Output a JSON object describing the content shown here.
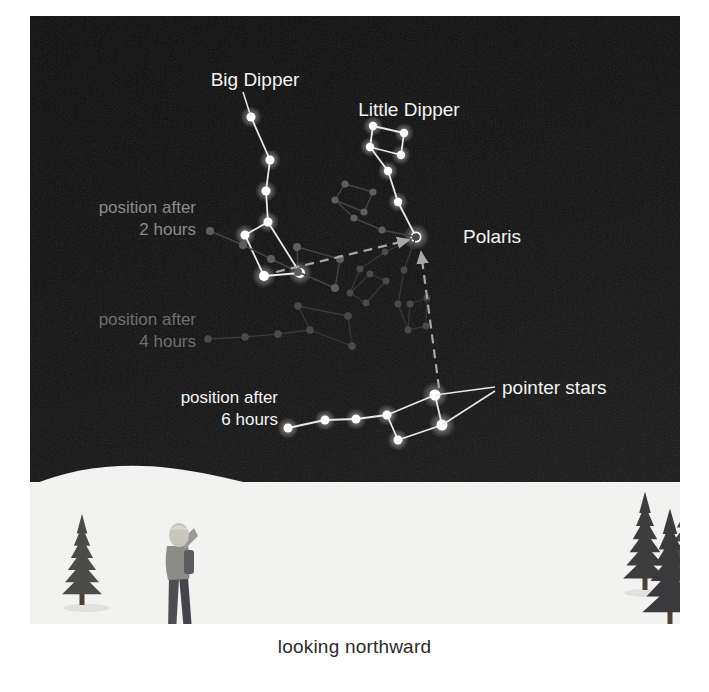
{
  "figure": {
    "caption": "looking northward",
    "view_direction": "north",
    "background_sky_color": "#0b0b0c",
    "snow_color": "#f2f2f0",
    "hill_color": "#1d1d20",
    "tree_color": "#3a3a3c"
  },
  "labels": {
    "big_dipper": "Big Dipper",
    "little_dipper": "Little Dipper",
    "polaris": "Polaris",
    "pointer_stars": "pointer stars",
    "position_2h_line1": "position after",
    "position_2h_line2": "2 hours",
    "position_4h_line1": "position after",
    "position_4h_line2": "4 hours",
    "position_6h_line1": "position after",
    "position_6h_line2": "6 hours"
  },
  "label_colors": {
    "bright": "#f4f4f2",
    "dim_2h": "#8b8b88",
    "dim_4h": "#6f6f6c",
    "bright_6h": "#f4f4f2"
  },
  "chart_data": {
    "type": "diagram",
    "subtitle": "looking northward",
    "annotations": [
      {
        "text": "Big Dipper",
        "x": 225,
        "y": 65,
        "color": "#f4f4f2",
        "size": 19,
        "anchor": "middle"
      },
      {
        "text": "Little Dipper",
        "x": 379,
        "y": 95,
        "color": "#f4f4f2",
        "size": 19,
        "anchor": "middle"
      },
      {
        "text": "Polaris",
        "x": 433,
        "y": 222,
        "color": "#f4f4f2",
        "size": 19,
        "anchor": "start"
      },
      {
        "text": "pointer stars",
        "x": 472,
        "y": 373,
        "color": "#f4f4f2",
        "size": 19,
        "anchor": "start"
      },
      {
        "text": "position after",
        "x": 166,
        "y": 193,
        "color": "#8b8b88",
        "size": 17,
        "anchor": "end"
      },
      {
        "text": "2 hours",
        "x": 166,
        "y": 215,
        "color": "#8b8b88",
        "size": 17,
        "anchor": "end"
      },
      {
        "text": "position after",
        "x": 166,
        "y": 305,
        "color": "#6f6f6c",
        "size": 17,
        "anchor": "end"
      },
      {
        "text": "4 hours",
        "x": 166,
        "y": 327,
        "color": "#6f6f6c",
        "size": 17,
        "anchor": "end"
      },
      {
        "text": "position after",
        "x": 248,
        "y": 383,
        "color": "#f4f4f2",
        "size": 17,
        "anchor": "end"
      },
      {
        "text": "6 hours",
        "x": 248,
        "y": 405,
        "color": "#f4f4f2",
        "size": 17,
        "anchor": "end"
      }
    ],
    "polaris": {
      "x": 386,
      "y": 221,
      "radius": 5.5,
      "color": "#ffffff"
    },
    "constellations": [
      {
        "name": "Little Dipper",
        "brightness": "bright",
        "star_color": "#ffffff",
        "line_color": "#e8e8e6",
        "line_width": 1.8,
        "stars": [
          {
            "id": "polaris",
            "x": 386,
            "y": 221,
            "r": 5.5
          },
          {
            "id": "ld2",
            "x": 368,
            "y": 186,
            "r": 4.2
          },
          {
            "id": "ld3",
            "x": 358,
            "y": 155,
            "r": 4.2
          },
          {
            "id": "ld4",
            "x": 340,
            "y": 131,
            "r": 4.2
          },
          {
            "id": "ld5",
            "x": 343,
            "y": 110,
            "r": 4.2
          },
          {
            "id": "ld6",
            "x": 374,
            "y": 117,
            "r": 4.2
          },
          {
            "id": "ld7",
            "x": 371,
            "y": 139,
            "r": 4.2
          }
        ],
        "edges": [
          [
            0,
            1
          ],
          [
            1,
            2
          ],
          [
            2,
            3
          ],
          [
            3,
            4
          ],
          [
            4,
            5
          ],
          [
            5,
            6
          ],
          [
            6,
            3
          ]
        ]
      },
      {
        "name": "Big Dipper (current)",
        "brightness": "bright",
        "star_color": "#ffffff",
        "line_color": "#e8e8e6",
        "line_width": 1.8,
        "stars": [
          {
            "id": "bd1-handle-tip",
            "x": 221,
            "y": 101,
            "r": 4.5
          },
          {
            "id": "bd2",
            "x": 240,
            "y": 144,
            "r": 4.5
          },
          {
            "id": "bd3",
            "x": 236,
            "y": 175,
            "r": 4.5
          },
          {
            "id": "bd4-bowl-tr",
            "x": 238,
            "y": 206,
            "r": 4.5
          },
          {
            "id": "bd5-bowl-tl",
            "x": 215,
            "y": 219,
            "r": 4.5
          },
          {
            "id": "bd6-bowl-bl",
            "x": 234,
            "y": 260,
            "r": 5.0
          },
          {
            "id": "bd7-bowl-br",
            "x": 270,
            "y": 257,
            "r": 5.0
          }
        ],
        "edges": [
          [
            0,
            1
          ],
          [
            1,
            2
          ],
          [
            2,
            3
          ],
          [
            3,
            4
          ],
          [
            4,
            5
          ],
          [
            5,
            6
          ],
          [
            6,
            3
          ]
        ],
        "pointer_pair": [
          "bd6-bowl-bl",
          "bd7-bowl-br"
        ]
      },
      {
        "name": "Big Dipper after 2 hours",
        "brightness": "dim",
        "star_color": "#5e5e5c",
        "line_color": "#444442",
        "line_width": 1.4,
        "stars": [
          {
            "id": "p2-1",
            "x": 180,
            "y": 215,
            "r": 4.0
          },
          {
            "id": "p2-2",
            "x": 213,
            "y": 229,
            "r": 4.0
          },
          {
            "id": "p2-3",
            "x": 241,
            "y": 243,
            "r": 4.0
          },
          {
            "id": "p2-4",
            "x": 268,
            "y": 256,
            "r": 4.0
          },
          {
            "id": "p2-5",
            "x": 267,
            "y": 231,
            "r": 4.0
          },
          {
            "id": "p2-6",
            "x": 310,
            "y": 243,
            "r": 4.0
          },
          {
            "id": "p2-7",
            "x": 305,
            "y": 272,
            "r": 4.0
          }
        ],
        "edges": [
          [
            0,
            1
          ],
          [
            1,
            2
          ],
          [
            2,
            3
          ],
          [
            3,
            4
          ],
          [
            4,
            5
          ],
          [
            5,
            6
          ],
          [
            6,
            3
          ]
        ]
      },
      {
        "name": "Little Dipper after 2 hours",
        "brightness": "dim",
        "star_color": "#5e5e5c",
        "line_color": "#444442",
        "line_width": 1.4,
        "stars": [
          {
            "id": "l2-1",
            "x": 386,
            "y": 221,
            "r": 3.6
          },
          {
            "id": "l2-2",
            "x": 352,
            "y": 214,
            "r": 3.6
          },
          {
            "id": "l2-3",
            "x": 324,
            "y": 202,
            "r": 3.6
          },
          {
            "id": "l2-4",
            "x": 305,
            "y": 184,
            "r": 3.6
          },
          {
            "id": "l2-5",
            "x": 315,
            "y": 168,
            "r": 3.6
          },
          {
            "id": "l2-6",
            "x": 343,
            "y": 176,
            "r": 3.6
          },
          {
            "id": "l2-7",
            "x": 334,
            "y": 196,
            "r": 3.6
          }
        ],
        "edges": [
          [
            0,
            1
          ],
          [
            1,
            2
          ],
          [
            2,
            3
          ],
          [
            3,
            4
          ],
          [
            4,
            5
          ],
          [
            5,
            6
          ],
          [
            6,
            3
          ]
        ]
      },
      {
        "name": "Big Dipper after 4 hours",
        "brightness": "dimmer",
        "star_color": "#4a4a48",
        "line_color": "#383836",
        "line_width": 1.3,
        "stars": [
          {
            "id": "p4-1",
            "x": 178,
            "y": 323,
            "r": 3.8
          },
          {
            "id": "p4-2",
            "x": 215,
            "y": 321,
            "r": 3.8
          },
          {
            "id": "p4-3",
            "x": 248,
            "y": 318,
            "r": 3.8
          },
          {
            "id": "p4-4",
            "x": 280,
            "y": 314,
            "r": 3.8
          },
          {
            "id": "p4-5",
            "x": 268,
            "y": 290,
            "r": 3.8
          },
          {
            "id": "p4-6",
            "x": 318,
            "y": 300,
            "r": 3.8
          },
          {
            "id": "p4-7",
            "x": 322,
            "y": 330,
            "r": 3.8
          }
        ],
        "edges": [
          [
            0,
            1
          ],
          [
            1,
            2
          ],
          [
            2,
            3
          ],
          [
            3,
            4
          ],
          [
            4,
            5
          ],
          [
            5,
            6
          ],
          [
            6,
            3
          ]
        ]
      },
      {
        "name": "Little Dipper after 4 hours",
        "brightness": "dimmer",
        "star_color": "#4a4a48",
        "line_color": "#383836",
        "line_width": 1.3,
        "stars": [
          {
            "id": "l4-1",
            "x": 386,
            "y": 221,
            "r": 3.4
          },
          {
            "id": "l4-2",
            "x": 355,
            "y": 236,
            "r": 3.4
          },
          {
            "id": "l4-3",
            "x": 330,
            "y": 253,
            "r": 3.4
          },
          {
            "id": "l4-4",
            "x": 320,
            "y": 277,
            "r": 3.4
          },
          {
            "id": "l4-5",
            "x": 336,
            "y": 287,
            "r": 3.4
          },
          {
            "id": "l4-6",
            "x": 356,
            "y": 265,
            "r": 3.4
          },
          {
            "id": "l4-7",
            "x": 340,
            "y": 258,
            "r": 3.4
          }
        ],
        "edges": [
          [
            0,
            1
          ],
          [
            1,
            2
          ],
          [
            2,
            3
          ],
          [
            3,
            4
          ],
          [
            4,
            5
          ],
          [
            5,
            6
          ],
          [
            6,
            3
          ]
        ]
      },
      {
        "name": "Big Dipper after 6 hours",
        "brightness": "bright",
        "star_color": "#ffffff",
        "line_color": "#e8e8e6",
        "line_width": 1.8,
        "stars": [
          {
            "id": "p6-1",
            "x": 258,
            "y": 412,
            "r": 4.5
          },
          {
            "id": "p6-2",
            "x": 295,
            "y": 404,
            "r": 4.5
          },
          {
            "id": "p6-3",
            "x": 326,
            "y": 403,
            "r": 4.5
          },
          {
            "id": "p6-4",
            "x": 357,
            "y": 399,
            "r": 4.5
          },
          {
            "id": "p6-5",
            "x": 368,
            "y": 424,
            "r": 4.5
          },
          {
            "id": "p6-6",
            "x": 412,
            "y": 409,
            "r": 5.5
          },
          {
            "id": "p6-7",
            "x": 405,
            "y": 379,
            "r": 5.5
          }
        ],
        "edges": [
          [
            0,
            1
          ],
          [
            1,
            2
          ],
          [
            2,
            3
          ],
          [
            3,
            4
          ],
          [
            4,
            5
          ],
          [
            5,
            6
          ],
          [
            6,
            3
          ]
        ],
        "pointer_pair": [
          "p6-6",
          "p6-7"
        ]
      },
      {
        "name": "Little Dipper after 6 hours",
        "brightness": "dim",
        "star_color": "#4a4a48",
        "line_color": "#383836",
        "line_width": 1.3,
        "stars": [
          {
            "id": "l6-1",
            "x": 386,
            "y": 221,
            "r": 3.4
          },
          {
            "id": "l6-2",
            "x": 374,
            "y": 254,
            "r": 3.4
          },
          {
            "id": "l6-3",
            "x": 368,
            "y": 288,
            "r": 3.4
          },
          {
            "id": "l6-4",
            "x": 378,
            "y": 314,
            "r": 3.4
          },
          {
            "id": "l6-5",
            "x": 396,
            "y": 310,
            "r": 3.4
          },
          {
            "id": "l6-6",
            "x": 397,
            "y": 282,
            "r": 3.4
          },
          {
            "id": "l6-7",
            "x": 380,
            "y": 288,
            "r": 3.4
          }
        ],
        "edges": [
          [
            0,
            1
          ],
          [
            1,
            2
          ],
          [
            2,
            3
          ],
          [
            3,
            4
          ],
          [
            4,
            5
          ],
          [
            5,
            6
          ],
          [
            6,
            3
          ]
        ]
      }
    ],
    "pointer_arrows": [
      {
        "name": "horizontal-pointer-arrow",
        "from": {
          "x": 246,
          "y": 256
        },
        "to": {
          "x": 379,
          "y": 224
        },
        "style": "dashed",
        "color": "#a8a8a4",
        "width": 2.2
      },
      {
        "name": "vertical-pointer-arrow",
        "from": {
          "x": 409,
          "y": 372
        },
        "to": {
          "x": 391,
          "y": 236
        },
        "style": "dashed",
        "color": "#a8a8a4",
        "width": 2.2
      }
    ],
    "leader_lines": [
      {
        "name": "big-dipper-leader",
        "from": {
          "x": 213,
          "y": 76
        },
        "to": {
          "x": 221,
          "y": 101
        },
        "color": "#e8e8e6"
      },
      {
        "name": "pointer-leader-upper",
        "from": {
          "x": 405,
          "y": 379
        },
        "to": {
          "x": 465,
          "y": 371
        },
        "color": "#e8e8e6"
      },
      {
        "name": "pointer-leader-lower",
        "from": {
          "x": 412,
          "y": 409
        },
        "to": {
          "x": 465,
          "y": 375
        },
        "color": "#e8e8e6"
      }
    ],
    "landscape": {
      "hill_path": "M 0,470 C 40,452 90,446 140,452 C 200,459 250,478 320,490 C 380,500 440,492 500,482 C 560,472 610,470 650,476 L 650,608 L 0,608 Z",
      "snow_top_y": 470,
      "observer": {
        "x": 148,
        "y": 508,
        "height": 112,
        "facing": "up-right"
      },
      "trees": [
        {
          "x": 52,
          "y": 513,
          "height": 76,
          "width": 42
        },
        {
          "x": 615,
          "y": 492,
          "height": 82,
          "width": 46
        },
        {
          "x": 660,
          "y": 478,
          "height": 88,
          "width": 50
        },
        {
          "x": 640,
          "y": 512,
          "height": 98,
          "width": 58
        }
      ]
    }
  }
}
